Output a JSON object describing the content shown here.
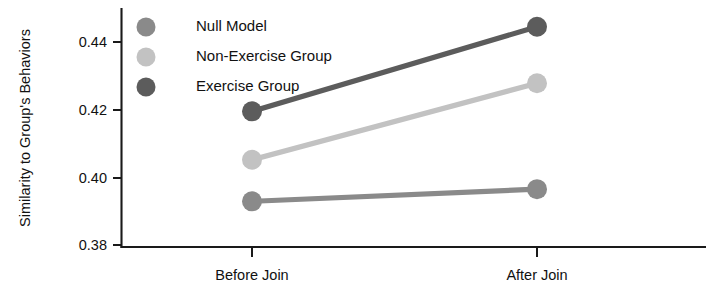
{
  "chart_data": {
    "type": "line",
    "title": "",
    "xlabel": "",
    "ylabel": "Similarity to Group's Behaviors",
    "categories": [
      "Before Join",
      "After Join"
    ],
    "x": [
      0,
      1
    ],
    "ylim": [
      0.375,
      0.4505
    ],
    "xlim": [
      -0.42,
      1.42
    ],
    "yticks": [
      0.38,
      0.4,
      0.42,
      0.44
    ],
    "ytick_labels": [
      "0.38",
      "0.40",
      "0.42",
      "0.44"
    ],
    "xtick_labels": [
      "Before Join",
      "After Join"
    ],
    "grid": false,
    "legend_position": "upper-left-inside",
    "marker": "circle",
    "series": [
      {
        "name": "Null Model",
        "color": "#8a8a8a",
        "values": [
          0.3929,
          0.3965
        ]
      },
      {
        "name": "Non-Exercise Group",
        "color": "#c2c2c2",
        "values": [
          0.4052,
          0.4278
        ]
      },
      {
        "name": "Exercise Group",
        "color": "#5c5c5c",
        "values": [
          0.4195,
          0.4445
        ]
      }
    ]
  },
  "axes": {
    "y_axis_title": "Similarity to Group's Behaviors",
    "axis_color": "#1a1a1a"
  },
  "legend": {
    "entries": [
      {
        "label": "Null Model",
        "marker": "legend-marker-null-model"
      },
      {
        "label": "Non-Exercise Group",
        "marker": "legend-marker-non-exercise-group"
      },
      {
        "label": "Exercise Group",
        "marker": "legend-marker-exercise-group"
      }
    ]
  }
}
